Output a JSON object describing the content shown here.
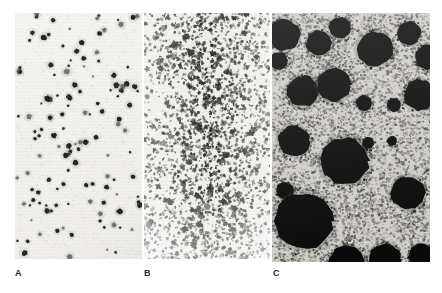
{
  "figure": {
    "type": "micrograph-panel-figure",
    "background_color": "#ffffff",
    "panel_count": 3,
    "panels": [
      {
        "id": "A",
        "label": "A",
        "name": "panel-a",
        "x": 15,
        "y": 13,
        "width": 127,
        "height": 246,
        "background_color": "#efeeeb",
        "feature_color": "#1a1a1a",
        "texture": "sparse-discrete-dots",
        "description": "Low-density field of small round dark colonies on a pale uniform background",
        "feature_count": 132,
        "feature_size_px": [
          2,
          6
        ],
        "mean_feature_size_px": 3.6,
        "coverage_percent": 4,
        "noise_level": 0.06,
        "seed": 1701
      },
      {
        "id": "B",
        "label": "B",
        "name": "panel-b",
        "x": 144,
        "y": 13,
        "width": 126,
        "height": 246,
        "background_color": "#edece8",
        "feature_color": "#232323",
        "texture": "fine-granular-speckle",
        "description": "Dense fine granular speckle of very small irregular dark particles, heaviest through the middle band",
        "feature_count": 3400,
        "feature_size_px": [
          1,
          3
        ],
        "mean_feature_size_px": 1.6,
        "coverage_percent": 22,
        "noise_level": 0.3,
        "seed": 2913
      },
      {
        "id": "C",
        "label": "C",
        "name": "panel-c",
        "x": 272,
        "y": 13,
        "width": 158,
        "height": 249,
        "background_color": "#cfcdc8",
        "feature_color": "#0a0a0a",
        "texture": "large-dark-colonies-on-speckled-field",
        "description": "Large irregular black colonies of varied size scattered over a grey speckled background",
        "feature_count": 22,
        "feature_size_px": [
          9,
          40
        ],
        "mean_feature_size_px": 22,
        "coverage_percent": 26,
        "noise_level": 0.22,
        "seed": 4457,
        "blobs": [
          {
            "cx": 12,
            "cy": 22,
            "r": 16
          },
          {
            "cx": 47,
            "cy": 30,
            "r": 13
          },
          {
            "cx": 68,
            "cy": 15,
            "r": 11
          },
          {
            "cx": 103,
            "cy": 36,
            "r": 18
          },
          {
            "cx": 137,
            "cy": 20,
            "r": 12
          },
          {
            "cx": 156,
            "cy": 44,
            "r": 13
          },
          {
            "cx": 7,
            "cy": 48,
            "r": 9
          },
          {
            "cx": 31,
            "cy": 78,
            "r": 16
          },
          {
            "cx": 62,
            "cy": 72,
            "r": 17
          },
          {
            "cx": 92,
            "cy": 90,
            "r": 8
          },
          {
            "cx": 122,
            "cy": 92,
            "r": 7
          },
          {
            "cx": 148,
            "cy": 82,
            "r": 16
          },
          {
            "cx": 22,
            "cy": 128,
            "r": 16
          },
          {
            "cx": 73,
            "cy": 148,
            "r": 24
          },
          {
            "cx": 136,
            "cy": 180,
            "r": 17
          },
          {
            "cx": 13,
            "cy": 178,
            "r": 9
          },
          {
            "cx": 32,
            "cy": 208,
            "r": 29
          },
          {
            "cx": 75,
            "cy": 250,
            "r": 18
          },
          {
            "cx": 113,
            "cy": 246,
            "r": 16
          },
          {
            "cx": 150,
            "cy": 243,
            "r": 13
          },
          {
            "cx": 96,
            "cy": 130,
            "r": 6
          },
          {
            "cx": 120,
            "cy": 128,
            "r": 5
          }
        ]
      }
    ]
  },
  "caption": {
    "label_a": "A",
    "label_b": "B",
    "label_c": "C"
  }
}
